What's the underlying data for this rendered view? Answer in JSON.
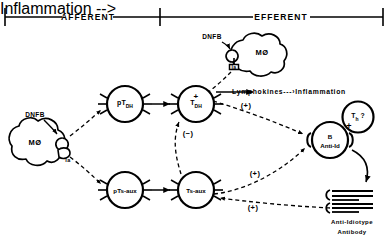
{
  "diagram": {
    "header": {
      "afferent_label": "AFFERENT",
      "efferent_label": "EFFERENT"
    },
    "hapten": {
      "left_label": "DNFB",
      "top_label": "DNFB"
    },
    "cells": {
      "macrophage_left": {
        "label": "MØ",
        "marker": "Ia"
      },
      "macrophage_top": {
        "label": "MØ",
        "marker": "Ia"
      },
      "ptdh": {
        "label": "pT",
        "sub": "DH"
      },
      "tdh": {
        "label": "T",
        "sub": "DH"
      },
      "ptsaux": {
        "label": "pTs-aux"
      },
      "tsaux": {
        "label": "Ts-aux"
      },
      "banti": {
        "line1": "B",
        "line2": "Anti-Id"
      },
      "th": {
        "label": "T",
        "sub": "h",
        "query": " ?"
      }
    },
    "mediators": {
      "lymphokines": "Lymphokines",
      "dashes": "---",
      "inflammation": "Inflammation"
    },
    "antibody": {
      "line1": "Anti-Idiotype",
      "line2": "Antibody"
    },
    "signs": {
      "plus_lymphokine": "+",
      "plus_b_from_tdh": "(+)",
      "minus_tsaux_to_tdh": "(−)",
      "plus_b_from_tsaux": "(+)",
      "plus_tsaux_from_ab": "(+)",
      "plus_th_to_b": "+"
    },
    "colors": {
      "ink": "#000000",
      "background": "#ffffff"
    }
  }
}
